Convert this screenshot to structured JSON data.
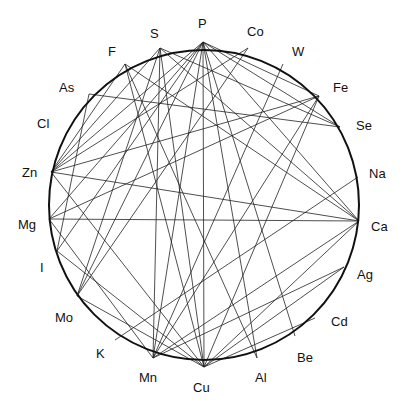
{
  "diagram": {
    "type": "chord",
    "center": [
      204,
      205
    ],
    "radius": 155,
    "colors": {
      "ring": "#111111",
      "chord": "#222222",
      "label": "#111111"
    },
    "nodes": [
      {
        "id": "P",
        "label": "P",
        "pt": [
          203,
          42
        ],
        "lbl": [
          198,
          28
        ]
      },
      {
        "id": "Co",
        "label": "Co",
        "pt": [
          248,
          48
        ],
        "lbl": [
          247,
          36
        ]
      },
      {
        "id": "W",
        "label": "W",
        "pt": [
          283,
          64
        ],
        "lbl": [
          292,
          56
        ]
      },
      {
        "id": "Fe",
        "label": "Fe",
        "pt": [
          319,
          96
        ],
        "lbl": [
          333,
          92
        ]
      },
      {
        "id": "Se",
        "label": "Se",
        "pt": [
          340,
          127
        ],
        "lbl": [
          356,
          130
        ]
      },
      {
        "id": "Na",
        "label": "Na",
        "pt": [
          358,
          177
        ],
        "lbl": [
          369,
          178
        ]
      },
      {
        "id": "Ca",
        "label": "Ca",
        "pt": [
          359,
          221
        ],
        "lbl": [
          371,
          231
        ]
      },
      {
        "id": "Ag",
        "label": "Ag",
        "pt": [
          344,
          267
        ],
        "lbl": [
          357,
          279
        ]
      },
      {
        "id": "Cd",
        "label": "Cd",
        "pt": [
          315,
          318
        ],
        "lbl": [
          331,
          326
        ]
      },
      {
        "id": "Be",
        "label": "Be",
        "pt": [
          295,
          336
        ],
        "lbl": [
          297,
          362
        ]
      },
      {
        "id": "Al",
        "label": "Al",
        "pt": [
          257,
          358
        ],
        "lbl": [
          255,
          382
        ]
      },
      {
        "id": "Cu",
        "label": "Cu",
        "pt": [
          204,
          367
        ],
        "lbl": [
          193,
          392
        ]
      },
      {
        "id": "Mn",
        "label": "Mn",
        "pt": [
          153,
          358
        ],
        "lbl": [
          139,
          382
        ]
      },
      {
        "id": "K",
        "label": "K",
        "pt": [
          115,
          340
        ],
        "lbl": [
          96,
          358
        ]
      },
      {
        "id": "Mo",
        "label": "Mo",
        "pt": [
          77,
          296
        ],
        "lbl": [
          55,
          322
        ]
      },
      {
        "id": "I",
        "label": "I",
        "pt": [
          57,
          251
        ],
        "lbl": [
          40,
          272
        ]
      },
      {
        "id": "Mg",
        "label": "Mg",
        "pt": [
          49,
          219
        ],
        "lbl": [
          18,
          229
        ]
      },
      {
        "id": "Zn",
        "label": "Zn",
        "pt": [
          51,
          172
        ],
        "lbl": [
          22,
          177
        ]
      },
      {
        "id": "Cl",
        "label": "Cl",
        "pt": [
          64,
          130
        ],
        "lbl": [
          37,
          128
        ]
      },
      {
        "id": "As",
        "label": "As",
        "pt": [
          89,
          94
        ],
        "lbl": [
          59,
          92
        ]
      },
      {
        "id": "F",
        "label": "F",
        "pt": [
          125,
          64
        ],
        "lbl": [
          108,
          56
        ]
      },
      {
        "id": "S",
        "label": "S",
        "pt": [
          160,
          48
        ],
        "lbl": [
          150,
          38
        ]
      }
    ],
    "edges": [
      [
        "P",
        "Cu"
      ],
      [
        "P",
        "Fe"
      ],
      [
        "P",
        "Se"
      ],
      [
        "P",
        "Ca"
      ],
      [
        "P",
        "Zn"
      ],
      [
        "P",
        "Mo"
      ],
      [
        "P",
        "Mn"
      ],
      [
        "P",
        "Al"
      ],
      [
        "P",
        "Be"
      ],
      [
        "P",
        "I"
      ],
      [
        "P",
        "Mg"
      ],
      [
        "S",
        "Se"
      ],
      [
        "S",
        "Ca"
      ],
      [
        "S",
        "Mn"
      ],
      [
        "S",
        "Cu"
      ],
      [
        "S",
        "Zn"
      ],
      [
        "S",
        "Mo"
      ],
      [
        "F",
        "Ca"
      ],
      [
        "F",
        "Al"
      ],
      [
        "F",
        "Zn"
      ],
      [
        "F",
        "Cu"
      ],
      [
        "As",
        "Se"
      ],
      [
        "As",
        "I"
      ],
      [
        "Co",
        "Zn"
      ],
      [
        "Co",
        "Mo"
      ],
      [
        "W",
        "Mn"
      ],
      [
        "Fe",
        "Zn"
      ],
      [
        "Fe",
        "Cu"
      ],
      [
        "Fe",
        "Mg"
      ],
      [
        "Zn",
        "Ca"
      ],
      [
        "Zn",
        "Cu"
      ],
      [
        "Mg",
        "Ca"
      ],
      [
        "Mg",
        "Mn"
      ],
      [
        "I",
        "Cu"
      ],
      [
        "Mo",
        "Cu"
      ],
      [
        "Na",
        "K"
      ],
      [
        "Ca",
        "Mn"
      ],
      [
        "Ca",
        "Cu"
      ],
      [
        "Ag",
        "Cu"
      ],
      [
        "Cd",
        "Cu"
      ],
      [
        "Mn",
        "Fe"
      ],
      [
        "Mn",
        "Ag"
      ]
    ]
  }
}
